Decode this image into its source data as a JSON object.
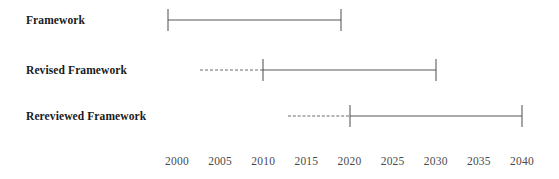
{
  "chart_data": {
    "type": "bar",
    "title": "",
    "subtitle": "",
    "xlabel": "",
    "ylabel": "",
    "orientation": "horizontal",
    "style": "timeline-range-bars",
    "grid": false,
    "legend": null,
    "xlim": [
      1999,
      2041
    ],
    "axis_ticks": [
      "2000",
      "2005",
      "2010",
      "2015",
      "2020",
      "2025",
      "2030",
      "2035",
      "2040"
    ],
    "axis_tick_values": [
      2000,
      2005,
      2010,
      2015,
      2020,
      2025,
      2030,
      2035,
      2040
    ],
    "categories": [
      "Framework",
      "Revised Framework",
      "Rereviewed Framework"
    ],
    "series": [
      {
        "name": "Framework",
        "label": "Framework",
        "dashed_start": null,
        "solid_start": 1999,
        "end": 2019,
        "has_dashed_lead": false,
        "start_cap": true,
        "end_cap": true
      },
      {
        "name": "Revised Framework",
        "label": "Revised Framework",
        "dashed_start": 2002.7,
        "solid_start": 2010,
        "end": 2030,
        "has_dashed_lead": true,
        "start_cap": true,
        "end_cap": true
      },
      {
        "name": "Rereviewed Framework",
        "label": "Rereviewed Framework",
        "dashed_start": 2012.9,
        "solid_start": 2020,
        "end": 2040,
        "has_dashed_lead": true,
        "start_cap": true,
        "end_cap": true
      }
    ],
    "colors": {
      "line": "#59595b",
      "dashed_line": "#6b6b6d",
      "cap": "#4c4c4e",
      "label_text": "#1a1a1a",
      "tick_text": "#4a4a4c",
      "background": "#ffffff"
    }
  },
  "rows": [
    {
      "label": "Framework"
    },
    {
      "label": "Revised Framework"
    },
    {
      "label": "Rereviewed Framework"
    }
  ],
  "axis": {
    "ticks": [
      {
        "label": "2000"
      },
      {
        "label": "2005"
      },
      {
        "label": "2010"
      },
      {
        "label": "2015"
      },
      {
        "label": "2020"
      },
      {
        "label": "2025"
      },
      {
        "label": "2030"
      },
      {
        "label": "2035"
      },
      {
        "label": "2040"
      }
    ]
  }
}
